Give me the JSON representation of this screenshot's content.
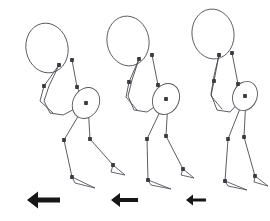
{
  "figure": {
    "background_color": "#ffffff",
    "stroke_color": "#4a4a52",
    "joint_color": "#3a3a40",
    "arrow_color": "#171717",
    "pose_count": 3,
    "arrow_direction": "left",
    "arrow_label": "leftward motion arrow"
  },
  "chart_data": {
    "type": "scatter",
    "xlabel": "",
    "ylabel": "",
    "xlim": [
      0,
      270
    ],
    "ylim": [
      0,
      221
    ],
    "grid": false,
    "legend": "none",
    "poses": [
      {
        "name": "pose-1",
        "x_offset": 0,
        "head": {
          "cx": 47,
          "cy": 48,
          "rx": 21,
          "ry": 25,
          "rotation": -12
        },
        "pelvis": {
          "cx": 86,
          "cy": 103,
          "rx": 13,
          "ry": 16,
          "rotation": 28
        },
        "joints": [
          {
            "name": "neck",
            "x": 59,
            "y": 65
          },
          {
            "name": "shoulder",
            "x": 72,
            "y": 60
          },
          {
            "name": "elbow-front",
            "x": 44,
            "y": 86
          },
          {
            "name": "elbow-back",
            "x": 77,
            "y": 87
          },
          {
            "name": "hip",
            "x": 86,
            "y": 103
          },
          {
            "name": "knee-front",
            "x": 64,
            "y": 140
          },
          {
            "name": "knee-back",
            "x": 90,
            "y": 139
          },
          {
            "name": "ankle-front",
            "x": 72,
            "y": 177
          },
          {
            "name": "ankle-back",
            "x": 113,
            "y": 165
          }
        ],
        "spine": [
          [
            59,
            65
          ],
          [
            49,
            86
          ],
          [
            44,
            101
          ],
          [
            50,
            113
          ],
          [
            63,
            115
          ],
          [
            86,
            103
          ]
        ],
        "arm_back": [
          [
            72,
            60
          ],
          [
            77,
            87
          ],
          [
            84,
            101
          ]
        ],
        "arm_front": [
          [
            59,
            65
          ],
          [
            44,
            86
          ],
          [
            40,
            101
          ],
          [
            53,
            113
          ]
        ],
        "leg_front": [
          [
            86,
            103
          ],
          [
            64,
            140
          ],
          [
            72,
            177
          ]
        ],
        "leg_back": [
          [
            88,
            104
          ],
          [
            90,
            139
          ],
          [
            113,
            165
          ]
        ],
        "foot_front": [
          [
            72,
            177
          ],
          [
            95,
            188
          ],
          [
            75,
            183
          ]
        ],
        "foot_back": [
          [
            113,
            165
          ],
          [
            125,
            175
          ],
          [
            111,
            172
          ]
        ],
        "arrow": {
          "x": 27,
          "y": 200,
          "length": 33,
          "head_size": 11,
          "shaft": 5
        }
      },
      {
        "name": "pose-2",
        "x_offset": 80,
        "head": {
          "cx": 128,
          "cy": 41,
          "rx": 21,
          "ry": 25,
          "rotation": -10
        },
        "pelvis": {
          "cx": 166,
          "cy": 99,
          "rx": 13,
          "ry": 16,
          "rotation": 25
        },
        "joints": [
          {
            "name": "neck",
            "x": 139,
            "y": 59
          },
          {
            "name": "shoulder",
            "x": 152,
            "y": 55
          },
          {
            "name": "elbow-front",
            "x": 129,
            "y": 82
          },
          {
            "name": "elbow-back",
            "x": 158,
            "y": 85
          },
          {
            "name": "hip",
            "x": 166,
            "y": 99
          },
          {
            "name": "knee-front",
            "x": 147,
            "y": 139
          },
          {
            "name": "knee-back",
            "x": 166,
            "y": 136
          },
          {
            "name": "ankle-front",
            "x": 148,
            "y": 180
          },
          {
            "name": "ankle-back",
            "x": 183,
            "y": 169
          }
        ],
        "spine": [
          [
            139,
            59
          ],
          [
            132,
            80
          ],
          [
            128,
            96
          ],
          [
            134,
            110
          ],
          [
            147,
            112
          ],
          [
            166,
            99
          ]
        ],
        "arm_back": [
          [
            152,
            55
          ],
          [
            158,
            85
          ],
          [
            163,
            98
          ]
        ],
        "arm_front": [
          [
            139,
            59
          ],
          [
            129,
            82
          ],
          [
            126,
            97
          ],
          [
            137,
            110
          ]
        ],
        "leg_front": [
          [
            166,
            99
          ],
          [
            147,
            139
          ],
          [
            148,
            180
          ]
        ],
        "leg_back": [
          [
            168,
            100
          ],
          [
            166,
            136
          ],
          [
            183,
            169
          ]
        ],
        "foot_front": [
          [
            148,
            180
          ],
          [
            171,
            189
          ],
          [
            151,
            185
          ]
        ],
        "foot_back": [
          [
            183,
            169
          ],
          [
            194,
            178
          ],
          [
            181,
            175
          ]
        ],
        "arrow": {
          "x": 111,
          "y": 200,
          "length": 27,
          "head_size": 9,
          "shaft": 4
        }
      },
      {
        "name": "pose-3",
        "x_offset": 158,
        "head": {
          "cx": 213,
          "cy": 34,
          "rx": 21,
          "ry": 25,
          "rotation": -8
        },
        "pelvis": {
          "cx": 245,
          "cy": 96,
          "rx": 12,
          "ry": 15,
          "rotation": 22
        },
        "joints": [
          {
            "name": "neck",
            "x": 219,
            "y": 55
          },
          {
            "name": "shoulder",
            "x": 232,
            "y": 53
          },
          {
            "name": "elbow-front",
            "x": 214,
            "y": 81
          },
          {
            "name": "elbow-back",
            "x": 238,
            "y": 84
          },
          {
            "name": "hip",
            "x": 245,
            "y": 96
          },
          {
            "name": "knee-front",
            "x": 228,
            "y": 139
          },
          {
            "name": "knee-back",
            "x": 244,
            "y": 137
          },
          {
            "name": "ankle-front",
            "x": 225,
            "y": 181
          },
          {
            "name": "ankle-back",
            "x": 255,
            "y": 176
          }
        ],
        "spine": [
          [
            219,
            55
          ],
          [
            214,
            76
          ],
          [
            211,
            94
          ],
          [
            217,
            110
          ],
          [
            230,
            112
          ],
          [
            245,
            96
          ]
        ],
        "arm_back": [
          [
            232,
            53
          ],
          [
            238,
            84
          ],
          [
            243,
            95
          ]
        ],
        "arm_front": [
          [
            219,
            55
          ],
          [
            214,
            81
          ],
          [
            211,
            96
          ],
          [
            222,
            109
          ]
        ],
        "leg_front": [
          [
            245,
            96
          ],
          [
            228,
            139
          ],
          [
            225,
            181
          ]
        ],
        "leg_back": [
          [
            246,
            97
          ],
          [
            244,
            137
          ],
          [
            255,
            176
          ]
        ],
        "foot_front": [
          [
            225,
            181
          ],
          [
            247,
            190
          ],
          [
            228,
            186
          ]
        ],
        "foot_back": [
          [
            255,
            176
          ],
          [
            268,
            186
          ],
          [
            254,
            182
          ]
        ],
        "arrow": {
          "x": 186,
          "y": 200,
          "length": 20,
          "head_size": 7,
          "shaft": 3
        }
      }
    ]
  }
}
